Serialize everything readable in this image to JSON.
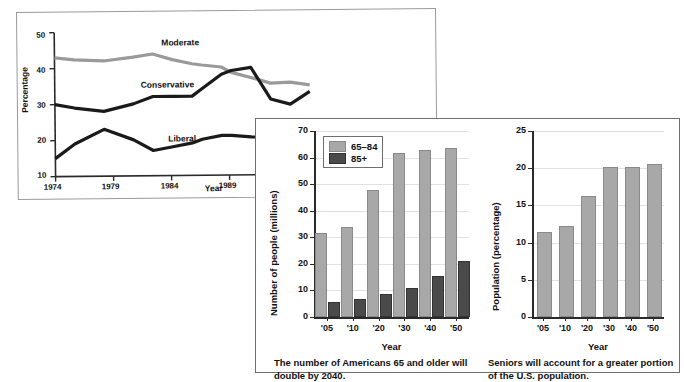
{
  "figure": {
    "panels": [
      "line-chart-ideology",
      "bar-chart-seniors-count",
      "bar-chart-seniors-percent"
    ]
  },
  "chart_data": [
    {
      "id": "ideology-trend",
      "type": "line",
      "title": "",
      "xlabel": "Year",
      "ylabel": "Percentage",
      "ylim": [
        10,
        50
      ],
      "yticks": [
        10,
        20,
        30,
        40,
        50
      ],
      "xticks": [
        "1974",
        "1979",
        "1984",
        "1989",
        "1994"
      ],
      "grid": false,
      "legend": "inline-labels",
      "x": [
        1974,
        1976,
        1979,
        1982,
        1984,
        1986,
        1988,
        1989,
        1991,
        1992,
        1994,
        1996,
        1998,
        2000
      ],
      "series": [
        {
          "name": "Moderate",
          "color": "#9a9a9a",
          "values": [
            43,
            42.4,
            42,
            43,
            43.8,
            42.2,
            41,
            40.6,
            40,
            38.5,
            37,
            35.4,
            35.6,
            34.8
          ]
        },
        {
          "name": "Conservative",
          "color": "#1a1a1a",
          "values": [
            30,
            29,
            28,
            30,
            32,
            32,
            32,
            34,
            38,
            39,
            39.8,
            31,
            29.5,
            33
          ]
        },
        {
          "name": "Liberal",
          "color": "#1a1a1a",
          "values": [
            15,
            19,
            23,
            20,
            17,
            18,
            19,
            20,
            21,
            21,
            20.5,
            20.4,
            20.4,
            20.4
          ]
        }
      ],
      "annotations": [
        {
          "text": "Moderate",
          "near": "moderate-line"
        },
        {
          "text": "Conservative",
          "near": "conservative-line"
        },
        {
          "text": "Liberal",
          "near": "liberal-line"
        }
      ]
    },
    {
      "id": "seniors-count",
      "type": "bar",
      "title": "",
      "xlabel": "Year",
      "ylabel": "Number of people (millions)",
      "ylim": [
        0,
        70
      ],
      "yticks": [
        0,
        10,
        20,
        30,
        40,
        50,
        60,
        70
      ],
      "categories": [
        "'05",
        "'10",
        "'20",
        "'30",
        "'40",
        "'50"
      ],
      "grid": true,
      "legend_position": "top-left",
      "series": [
        {
          "name": "65–84",
          "color": "#a8a8a8",
          "values": [
            31,
            33,
            47,
            61,
            62,
            63
          ]
        },
        {
          "name": "85+",
          "color": "#4a4a4a",
          "values": [
            5,
            6,
            8,
            10,
            14.5,
            20.5
          ]
        }
      ],
      "caption": "The number of Americans 65 and older will double by 2040."
    },
    {
      "id": "seniors-percent",
      "type": "bar",
      "title": "",
      "xlabel": "Year",
      "ylabel": "Population (percentage)",
      "ylim": [
        0,
        25
      ],
      "yticks": [
        0,
        5,
        10,
        15,
        20,
        25
      ],
      "categories": [
        "'05",
        "'10",
        "'20",
        "'30",
        "'40",
        "'50"
      ],
      "grid": true,
      "legend_position": "none",
      "series": [
        {
          "name": "Population 65+",
          "color": "#a8a8a8",
          "values": [
            11.2,
            12,
            16,
            19.9,
            19.9,
            20.3
          ]
        }
      ],
      "caption": "Seniors will account for a greater portion of the U.S. population."
    }
  ]
}
